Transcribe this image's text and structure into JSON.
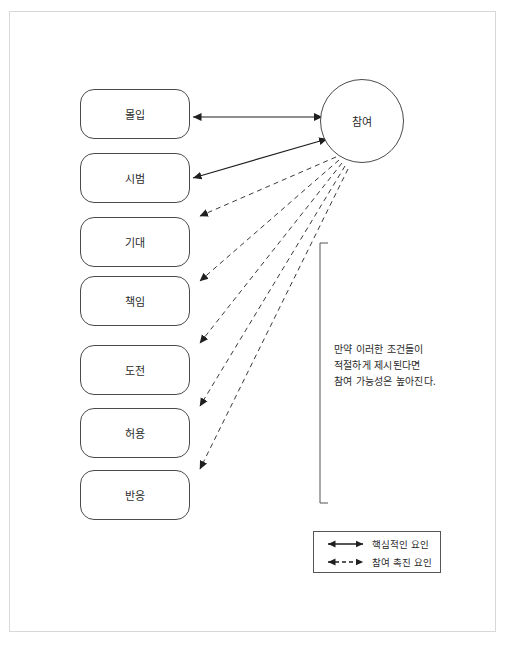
{
  "diagram": {
    "title_present": false,
    "hub": {
      "label": "참여",
      "shape": "circle",
      "cx": 362,
      "cy": 121,
      "r": 42
    },
    "factor_boxes": [
      {
        "label": "몰입",
        "x": 80,
        "y": 89,
        "arrow_type": "solid"
      },
      {
        "label": "시범",
        "x": 80,
        "y": 153,
        "arrow_type": "solid"
      },
      {
        "label": "기대",
        "x": 80,
        "y": 217,
        "arrow_type": "dashed"
      },
      {
        "label": "책임",
        "x": 80,
        "y": 276,
        "arrow_type": "dashed"
      },
      {
        "label": "도전",
        "x": 80,
        "y": 345,
        "arrow_type": "dashed"
      },
      {
        "label": "허용",
        "x": 80,
        "y": 408,
        "arrow_type": "dashed"
      },
      {
        "label": "반응",
        "x": 80,
        "y": 470,
        "arrow_type": "dashed"
      }
    ],
    "condition_note": {
      "lines": [
        "만약 이러한 조건들이",
        "적절하게 제시된다면",
        "참여 가능성은 높아진다."
      ]
    },
    "bracket": {
      "x": 320,
      "top": 243,
      "bottom": 503,
      "tick": 8
    },
    "legend": {
      "items": [
        {
          "label": "핵심적인 요인",
          "style": "solid",
          "arrowheads": "both"
        },
        {
          "label": "참여 촉진 요인",
          "style": "dashed",
          "arrowheads": "both"
        }
      ]
    },
    "colors": {
      "stroke": "#3a3a3a",
      "box_stroke": "#4a4a4a",
      "frame": "#d8d8d8",
      "text": "#2b2b2b",
      "background": "#ffffff"
    },
    "connectors": [
      {
        "from": "몰입",
        "to": "참여",
        "style": "solid",
        "arrowheads": "both",
        "x1": 193,
        "y1": 117,
        "x2": 322,
        "y2": 117
      },
      {
        "from": "시범",
        "to": "참여",
        "style": "solid",
        "arrowheads": "both",
        "x1": 193,
        "y1": 178,
        "x2": 327,
        "y2": 139
      },
      {
        "from": "참여",
        "to": "기대",
        "style": "dashed",
        "arrowheads": "end",
        "x1": 336,
        "y1": 157,
        "x2": 196,
        "y2": 216
      },
      {
        "from": "참여",
        "to": "책임",
        "style": "dashed",
        "arrowheads": "end",
        "x1": 339,
        "y1": 160,
        "x2": 196,
        "y2": 281
      },
      {
        "from": "참여",
        "to": "도전",
        "style": "dashed",
        "arrowheads": "end",
        "x1": 342,
        "y1": 163,
        "x2": 196,
        "y2": 343
      },
      {
        "from": "참여",
        "to": "허용",
        "style": "dashed",
        "arrowheads": "end",
        "x1": 345,
        "y1": 166,
        "x2": 196,
        "y2": 406
      },
      {
        "from": "참여",
        "to": "반응",
        "style": "dashed",
        "arrowheads": "end",
        "x1": 348,
        "y1": 169,
        "x2": 196,
        "y2": 469
      }
    ]
  }
}
